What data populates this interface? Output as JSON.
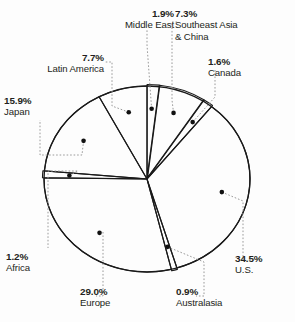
{
  "chart_data": {
    "type": "pie",
    "title": "",
    "subtitle": "",
    "xlabel": "",
    "ylabel": "",
    "legend": "none",
    "grid": false,
    "unit": "percent",
    "categories": [
      "Middle East",
      "Southeast Asia & China",
      "Canada",
      "U.S.",
      "Australasia",
      "Europe",
      "Africa",
      "Japan",
      "Latin America"
    ],
    "values": [
      1.9,
      7.3,
      1.6,
      34.5,
      0.9,
      29.0,
      1.2,
      15.9,
      7.7
    ],
    "slices": [
      {
        "label": "Middle East",
        "value": 1.9,
        "pct_text": "1.9%",
        "name_text": "Middle East"
      },
      {
        "label": "Southeast Asia & China",
        "value": 7.3,
        "pct_text": "7.3%",
        "name_text": "Southeast Asia & China",
        "name_line1": "Southeast Asia",
        "name_line2": "& China"
      },
      {
        "label": "Canada",
        "value": 1.6,
        "pct_text": "1.6%",
        "name_text": "Canada"
      },
      {
        "label": "U.S.",
        "value": 34.5,
        "pct_text": "34.5%",
        "name_text": "U.S."
      },
      {
        "label": "Australasia",
        "value": 0.9,
        "pct_text": "0.9%",
        "name_text": "Australasia"
      },
      {
        "label": "Europe",
        "value": 29.0,
        "pct_text": "29.0%",
        "name_text": "Europe"
      },
      {
        "label": "Africa",
        "value": 1.2,
        "pct_text": "1.2%",
        "name_text": "Africa"
      },
      {
        "label": "Japan",
        "value": 15.9,
        "pct_text": "15.9%",
        "name_text": "Japan"
      },
      {
        "label": "Latin America",
        "value": 7.7,
        "pct_text": "7.7%",
        "name_text": "Latin America"
      }
    ],
    "total": 100.0,
    "colors": {
      "outline": "#1a1a1a",
      "marker": "#111111",
      "leader": "#9a9a9a",
      "background": "#fdfdfd",
      "text": "#231f20"
    },
    "geometry": {
      "center_x": 147,
      "center_y": 179,
      "radius_x": 103,
      "radius_y": 93,
      "start_angle_deg": -90,
      "direction": "clockwise"
    }
  }
}
